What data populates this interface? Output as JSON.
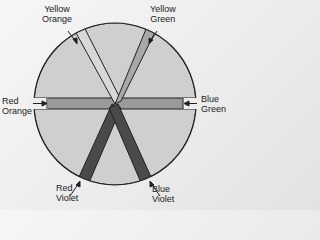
{
  "colors": {
    "background": "#eeeeee",
    "wedge_fill": "#cfcfcf",
    "outline": "#222222",
    "bar_horizontal": "#9a9a9a",
    "bar_yellow_orange": "#d8d8d8",
    "bar_yellow_green": "#a8a8a8",
    "bar_violet": "#4a4a4a"
  },
  "labels": {
    "yellow_orange": "Yellow\nOrange",
    "yellow_green": "Yellow\nGreen",
    "red_orange": "Red\nOrange",
    "blue_green": "Blue\nGreen",
    "red_violet": "Red\nViolet",
    "blue_violet": "Blue\nViolet"
  }
}
